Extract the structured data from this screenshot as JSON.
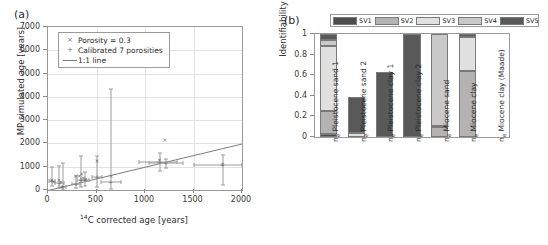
{
  "figure": {
    "panel_a_label": "(a)",
    "panel_b_label": "(b)"
  },
  "chart_data": [
    {
      "type": "scatter",
      "panel": "(a)",
      "title": "",
      "xlabel": "14C corrected age [years]",
      "xlabel_sup": "14",
      "xlabel_rest": "C corrected age [years]",
      "ylabel": "MP simulated age [years]",
      "xlim": [
        0,
        2000
      ],
      "ylim": [
        0,
        7000
      ],
      "xticks": [
        0,
        500,
        1000,
        1500,
        2000
      ],
      "yticks": [
        0,
        1000,
        2000,
        3000,
        4000,
        5000,
        6000,
        7000
      ],
      "grid": true,
      "legend_position": "upper-left",
      "legend": [
        {
          "label": "Porosity = 0.3",
          "marker": "x"
        },
        {
          "label": "Calibrated 7 porosities",
          "marker": "+"
        },
        {
          "label": "1:1 line",
          "marker": "line"
        }
      ],
      "reference_line": {
        "name": "1:1 line",
        "from": [
          0,
          0
        ],
        "to": [
          2000,
          2000
        ]
      },
      "series": [
        {
          "name": "Porosity = 0.3",
          "marker": "x",
          "points": [
            {
              "x": 40,
              "y": 430
            },
            {
              "x": 60,
              "y": 330
            },
            {
              "x": 110,
              "y": 420
            },
            {
              "x": 135,
              "y": 330
            },
            {
              "x": 150,
              "y": 150
            },
            {
              "x": 290,
              "y": 610
            },
            {
              "x": 320,
              "y": 620
            },
            {
              "x": 345,
              "y": 700
            },
            {
              "x": 360,
              "y": 520
            },
            {
              "x": 390,
              "y": 480
            },
            {
              "x": 505,
              "y": 1230
            },
            {
              "x": 650,
              "y": 600
            },
            {
              "x": 1150,
              "y": 1280
            },
            {
              "x": 1200,
              "y": 5750
            },
            {
              "x": 1205,
              "y": 2160
            },
            {
              "x": 1800,
              "y": 1100
            }
          ]
        },
        {
          "name": "Calibrated 7 porosities",
          "marker": "+",
          "points": [
            {
              "x": 40,
              "y": 380,
              "yerr_low": 220,
              "yerr_high": 620,
              "xerr_low": 30,
              "xerr_high": 30
            },
            {
              "x": 115,
              "y": 290,
              "yerr_low": 200,
              "yerr_high": 740,
              "xerr_low": 45,
              "xerr_high": 45
            },
            {
              "x": 150,
              "y": 140,
              "yerr_low": 120,
              "yerr_high": 1030,
              "xerr_low": 40,
              "xerr_high": 40
            },
            {
              "x": 290,
              "y": 250,
              "yerr_low": 180,
              "yerr_high": 330,
              "xerr_low": 40,
              "xerr_high": 40
            },
            {
              "x": 340,
              "y": 450,
              "yerr_low": 300,
              "yerr_high": 1000,
              "xerr_low": 45,
              "xerr_high": 45
            },
            {
              "x": 385,
              "y": 450,
              "yerr_low": 290,
              "yerr_high": 320,
              "xerr_low": 40,
              "xerr_high": 40
            },
            {
              "x": 505,
              "y": 540,
              "yerr_low": 420,
              "yerr_high": 910,
              "xerr_low": 55,
              "xerr_high": 55
            },
            {
              "x": 645,
              "y": 330,
              "yerr_low": 280,
              "yerr_high": 4000,
              "xerr_low": 100,
              "xerr_high": 110
            },
            {
              "x": 1150,
              "y": 1200,
              "yerr_low": 400,
              "yerr_high": 400,
              "xerr_low": 215,
              "xerr_high": 180
            },
            {
              "x": 1215,
              "y": 1150,
              "yerr_low": 200,
              "yerr_high": 200,
              "xerr_low": 175,
              "xerr_high": 175
            },
            {
              "x": 1800,
              "y": 1090,
              "yerr_low": 880,
              "yerr_high": 430,
              "xerr_low": 300,
              "xerr_high": 200
            }
          ]
        }
      ]
    },
    {
      "type": "bar",
      "subtype": "stacked",
      "panel": "(b)",
      "title": "",
      "xlabel": "",
      "ylabel": "Identifiability",
      "ylim": [
        0,
        1
      ],
      "yticks": [
        "0",
        "0.2",
        "0.4",
        "0.6",
        "0.8",
        "1"
      ],
      "grid": false,
      "legend_position": "top",
      "legend": [
        "SV1",
        "SV2",
        "SV3",
        "SV4",
        "SV5"
      ],
      "colors": {
        "SV1": "#4d4d4d",
        "SV2": "#b3b3b3",
        "SV3": "#e0e0e0",
        "SV4": "#c9c9c9",
        "SV5": "#595959"
      },
      "categories": [
        "n_e Pleistocene sand 1",
        "n_e Pleistocene sand 2",
        "n_e Pleistocene clay 1",
        "n_e Pleistocene clay 2",
        "n_e Miocene sand",
        "n_e Miocene clay",
        "n_e Miocene clay (Maade)"
      ],
      "category_parts": [
        {
          "prefix": "n",
          "sub": "e",
          "rest": " Pleistocene sand 1"
        },
        {
          "prefix": "n",
          "sub": "e",
          "rest": " Pleistocene sand 2"
        },
        {
          "prefix": "n",
          "sub": "e",
          "rest": " Pleistocene clay 1"
        },
        {
          "prefix": "n",
          "sub": "e",
          "rest": " Pleistocene clay 2"
        },
        {
          "prefix": "n",
          "sub": "e",
          "rest": " Miocene sand"
        },
        {
          "prefix": "n",
          "sub": "e",
          "rest": " Miocene clay"
        },
        {
          "prefix": "n",
          "sub": "e",
          "rest": " Miocene clay (Maade)"
        }
      ],
      "series": [
        {
          "name": "SV1",
          "values": [
            0.03,
            0.005,
            0.0,
            0.0,
            0.0,
            0.0,
            0.0
          ]
        },
        {
          "name": "SV2",
          "values": [
            0.22,
            0.0,
            0.0,
            0.0,
            0.1,
            0.64,
            0.0
          ]
        },
        {
          "name": "SV3",
          "values": [
            0.63,
            0.03,
            0.0,
            0.0,
            0.01,
            0.33,
            0.0
          ]
        },
        {
          "name": "SV4",
          "values": [
            0.06,
            0.0,
            0.0,
            0.0,
            0.89,
            0.0,
            0.0
          ]
        },
        {
          "name": "SV5",
          "values": [
            0.06,
            0.35,
            0.63,
            1.0,
            0.0,
            0.03,
            0.0
          ]
        }
      ],
      "totals": [
        1.0,
        0.385,
        0.63,
        1.0,
        1.0,
        1.0,
        0.0
      ]
    }
  ]
}
